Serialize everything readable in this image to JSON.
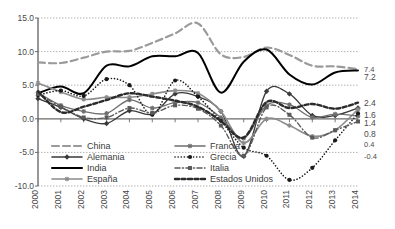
{
  "chart_data": {
    "type": "line",
    "title": "",
    "xlabel": "",
    "ylabel": "",
    "grid": true,
    "legend_position": "inside-bottom-left",
    "x": [
      "2000",
      "2001",
      "2002",
      "2003",
      "2004",
      "2005",
      "2006",
      "2007",
      "2008",
      "2009",
      "2010",
      "2011",
      "2012",
      "2013",
      "2014"
    ],
    "ylim": [
      -10.0,
      15.0
    ],
    "yticks": [
      "15.0",
      "10.0",
      "5.0",
      "0.0",
      "-5.0",
      "-10.0"
    ],
    "ytick_values": [
      15.0,
      10.0,
      5.0,
      0.0,
      -5.0,
      -10.0
    ],
    "right_labels": [
      "7.4",
      "7.2",
      "2.4",
      "1.6",
      "1.4",
      "0.8",
      "0.4",
      "-0.4"
    ],
    "right_label_values": [
      7.4,
      7.2,
      2.4,
      1.6,
      1.4,
      0.8,
      0.4,
      -0.4
    ],
    "series": [
      {
        "name": "China",
        "color": "#9a9a9a",
        "style": "long-dash",
        "marker": "none",
        "width": 2.2,
        "values": [
          8.4,
          8.3,
          9.1,
          10.0,
          10.1,
          11.3,
          12.7,
          14.2,
          9.6,
          9.2,
          10.6,
          9.5,
          7.9,
          7.8,
          7.4
        ]
      },
      {
        "name": "Alemania",
        "color": "#3a3a3a",
        "style": "solid",
        "marker": "diamond",
        "width": 1.3,
        "values": [
          3.0,
          1.7,
          0.0,
          -0.7,
          1.2,
          0.7,
          3.7,
          3.3,
          1.1,
          -5.6,
          4.1,
          3.7,
          0.5,
          0.5,
          1.6
        ]
      },
      {
        "name": "India",
        "color": "#000000",
        "style": "solid",
        "marker": "none",
        "width": 2.0,
        "values": [
          3.8,
          4.8,
          3.8,
          7.9,
          7.8,
          9.3,
          9.3,
          9.8,
          3.9,
          8.5,
          10.3,
          6.6,
          5.1,
          6.9,
          7.2
        ]
      },
      {
        "name": "España",
        "color": "#8c8c8c",
        "style": "solid",
        "marker": "star",
        "width": 1.6,
        "values": [
          5.3,
          4.0,
          2.9,
          3.2,
          3.2,
          3.7,
          4.2,
          3.8,
          1.1,
          -3.6,
          0.0,
          -1.0,
          -2.6,
          -1.7,
          1.4
        ]
      },
      {
        "name": "Francia",
        "color": "#6f6f6f",
        "style": "solid",
        "marker": "star",
        "width": 1.3,
        "values": [
          3.9,
          2.0,
          1.1,
          0.8,
          2.8,
          1.6,
          2.4,
          2.4,
          0.2,
          -2.9,
          2.0,
          2.1,
          0.2,
          0.7,
          0.4
        ]
      },
      {
        "name": "Grecia",
        "color": "#1a1a1a",
        "style": "dotted",
        "marker": "circle",
        "width": 1.6,
        "values": [
          3.5,
          4.2,
          3.4,
          5.9,
          5.0,
          0.6,
          5.7,
          3.3,
          -0.3,
          -4.3,
          -5.5,
          -9.1,
          -7.3,
          -3.2,
          0.8
        ]
      },
      {
        "name": "Italia",
        "color": "#5a5a5a",
        "style": "dash-dot",
        "marker": "square",
        "width": 1.4,
        "values": [
          3.7,
          1.8,
          0.2,
          0.2,
          1.6,
          0.9,
          2.0,
          1.5,
          -1.0,
          -5.5,
          1.7,
          0.6,
          -2.8,
          -1.7,
          -0.4
        ]
      },
      {
        "name": "Estados Unidos",
        "color": "#2b2b2b",
        "style": "thick-dash",
        "marker": "none",
        "width": 2.4,
        "values": [
          4.1,
          1.0,
          1.8,
          2.8,
          3.8,
          3.3,
          2.7,
          1.8,
          -0.3,
          -2.8,
          2.5,
          1.6,
          2.2,
          1.5,
          2.4
        ]
      }
    ],
    "legend": [
      {
        "label": "China",
        "col": 0,
        "row": 0
      },
      {
        "label": "Alemania",
        "col": 0,
        "row": 1
      },
      {
        "label": "India",
        "col": 0,
        "row": 2
      },
      {
        "label": "España",
        "col": 0,
        "row": 3
      },
      {
        "label": "Francia",
        "col": 1,
        "row": 0
      },
      {
        "label": "Grecia",
        "col": 1,
        "row": 1
      },
      {
        "label": "Italia",
        "col": 1,
        "row": 2
      },
      {
        "label": "Estados Unidos",
        "col": 1,
        "row": 3
      }
    ]
  }
}
